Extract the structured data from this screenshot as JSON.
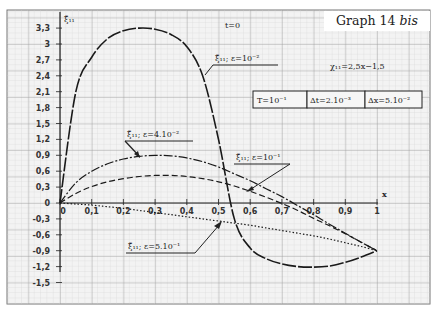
{
  "header": {
    "graph_label": "Graph 14",
    "graph_label_suffix": "bis",
    "time_label": "t=0",
    "chi_formula": "χ₁₁=2,5x−1,5",
    "params": [
      "T=10⁻¹",
      "Δt=2.10⁻³",
      "Δx=5.10⁻²"
    ]
  },
  "colors": {
    "paper": "#f4f4f4",
    "grid_minor": "#c8c8c8",
    "grid_major": "#8a8a8a",
    "ink": "#1a1a1a"
  },
  "chart_data": {
    "type": "line",
    "title": "Graph 14 bis",
    "subtitle": "t=0",
    "xlabel": "x",
    "ylabel": "ξ̃₁₁",
    "xlim": [
      0,
      1
    ],
    "ylim": [
      -1.5,
      3.3
    ],
    "grid": true,
    "x_ticks": [
      "0",
      "0,1",
      "0,2",
      "0,3",
      "0,4",
      "0,5",
      "0,6",
      "0,7",
      "0,8",
      "0,9",
      "1"
    ],
    "y_ticks": [
      "3,3",
      "3",
      "2,7",
      "2,4",
      "2,1",
      "1,8",
      "1,5",
      "1,2",
      "0,9",
      "0,6",
      "0,3",
      "0",
      "-0,3",
      "-0,6",
      "-0,9",
      "-1,2",
      "-1,5"
    ],
    "annotations": [
      "χ₁₁=2,5x−1,5",
      "T=10⁻¹",
      "Δt=2.10⁻³",
      "Δx=5.10⁻²"
    ],
    "x": [
      0,
      0.05,
      0.1,
      0.15,
      0.2,
      0.25,
      0.3,
      0.35,
      0.4,
      0.45,
      0.5,
      0.55,
      0.6,
      0.65,
      0.7,
      0.75,
      0.8,
      0.85,
      0.9,
      0.95,
      1
    ],
    "series": [
      {
        "name": "ξ̃₁₁; ε=10⁻²",
        "style": "long-dash",
        "values": [
          0,
          2.1,
          2.75,
          3.1,
          3.25,
          3.3,
          3.28,
          3.18,
          2.95,
          2.4,
          1.2,
          -0.3,
          -0.85,
          -1.05,
          -1.15,
          -1.2,
          -1.21,
          -1.19,
          -1.12,
          -1.02,
          -0.9
        ]
      },
      {
        "name": "ξ̃₁₁; ε=4.10⁻²",
        "style": "dash-dot",
        "values": [
          0,
          0.38,
          0.6,
          0.74,
          0.83,
          0.88,
          0.9,
          0.89,
          0.85,
          0.78,
          0.68,
          0.55,
          0.42,
          0.27,
          0.12,
          -0.05,
          -0.22,
          -0.4,
          -0.57,
          -0.74,
          -0.9
        ]
      },
      {
        "name": "ξ̃₁₁; ε=10⁻¹",
        "style": "dash",
        "values": [
          0,
          0.18,
          0.31,
          0.4,
          0.46,
          0.5,
          0.52,
          0.52,
          0.5,
          0.46,
          0.4,
          0.32,
          0.22,
          0.11,
          -0.01,
          -0.14,
          -0.29,
          -0.43,
          -0.58,
          -0.74,
          -0.9
        ]
      },
      {
        "name": "ξ̃₁₁; ε=5.10⁻¹",
        "style": "dotted",
        "values": [
          0,
          -0.02,
          -0.04,
          -0.07,
          -0.1,
          -0.14,
          -0.18,
          -0.22,
          -0.26,
          -0.3,
          -0.34,
          -0.38,
          -0.42,
          -0.47,
          -0.52,
          -0.57,
          -0.62,
          -0.68,
          -0.75,
          -0.82,
          -0.9
        ]
      }
    ],
    "curve_labels": [
      {
        "text": "ξ̃₁₁; ε=10⁻²"
      },
      {
        "text": "ξ̃₁₁; ε=4.10⁻²"
      },
      {
        "text": "ξ̃₁₁; ε=10⁻¹"
      },
      {
        "text": "ξ̃₁₁; ε=5.10⁻¹"
      }
    ]
  }
}
